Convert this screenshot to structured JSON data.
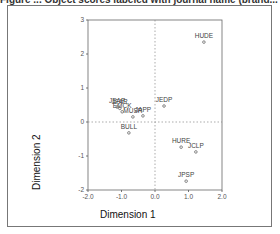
{
  "figure": {
    "title": "Figure ... Object scores labeled with journal name (brand..."
  },
  "chart_data": {
    "type": "scatter",
    "title": "Object scores labeled with journal name",
    "xlabel": "Dimension 1",
    "ylabel": "Dimension 2",
    "xlim": [
      -2.0,
      2.0
    ],
    "ylim": [
      -2,
      3
    ],
    "xticks": [
      "-2.0",
      "-1.0",
      "0.0",
      "1.0",
      "2.0"
    ],
    "yticks": [
      "3",
      "2",
      "1",
      "0",
      "-1",
      "-2"
    ],
    "reference_lines": {
      "x": 0,
      "y": 0,
      "style": "dotted"
    },
    "grid": false,
    "points": [
      {
        "label": "HUDE",
        "x": 1.46,
        "y": 2.35
      },
      {
        "label": "JEDP",
        "x": 0.27,
        "y": 0.47
      },
      {
        "label": "JEAP",
        "x": -1.13,
        "y": 0.44
      },
      {
        "label": "JFAR",
        "x": -1.05,
        "y": 0.4
      },
      {
        "label": "EMCK",
        "x": -0.98,
        "y": 0.3
      },
      {
        "label": "MUSR",
        "x": -0.66,
        "y": 0.15
      },
      {
        "label": "JAPP",
        "x": -0.36,
        "y": 0.18
      },
      {
        "label": "BULL",
        "x": -0.78,
        "y": -0.32
      },
      {
        "label": "HURE",
        "x": 0.78,
        "y": -0.74
      },
      {
        "label": "JCLP",
        "x": 1.22,
        "y": -0.88
      },
      {
        "label": "JPSP",
        "x": 0.93,
        "y": -1.74
      }
    ]
  }
}
